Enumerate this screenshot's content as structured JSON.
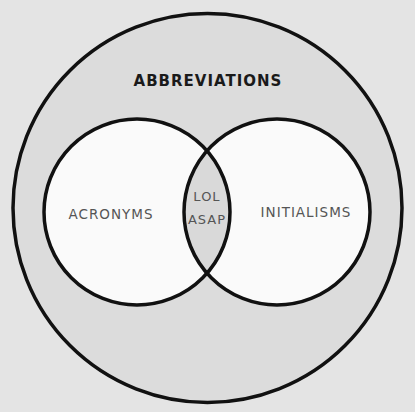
{
  "diagram": {
    "type": "venn",
    "outer_set": {
      "label": "ABBREVIATIONS"
    },
    "sets": [
      {
        "label": "ACRONYMS"
      },
      {
        "label": "INITIALISMS"
      }
    ],
    "intersection": {
      "items": [
        "LOL",
        "ASAP"
      ]
    }
  },
  "colors": {
    "background": "#e4e4e4",
    "outer_fill": "#dcdcdc",
    "inner_fill": "#fafafa",
    "intersection_fill": "#d9d9d9",
    "stroke": "#111111",
    "outer_label": "#1a1a1a",
    "inner_label": "#555555"
  }
}
